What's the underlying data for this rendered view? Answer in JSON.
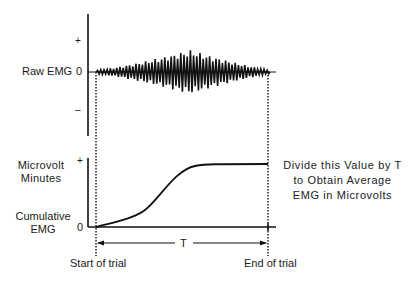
{
  "upper_panel": {
    "ylabel": "Raw EMG",
    "ticks": {
      "plus": "+",
      "zero": "0",
      "minus": "–"
    }
  },
  "lower_panel": {
    "ylabel_top_line1": "Microvolt",
    "ylabel_top_line2": "Minutes",
    "ylabel_bottom_line1": "Cumulative",
    "ylabel_bottom_line2": "EMG",
    "ticks": {
      "plus": "+",
      "zero": "0"
    }
  },
  "interval_label": "T",
  "start_label": "Start of trial",
  "end_label": "End of trial",
  "annotation": {
    "line1": "Divide this Value by T",
    "line2": "to Obtain Average",
    "line3": "EMG in Microvolts"
  },
  "colors": {
    "ink": "#111111",
    "background": "#ffffff"
  }
}
